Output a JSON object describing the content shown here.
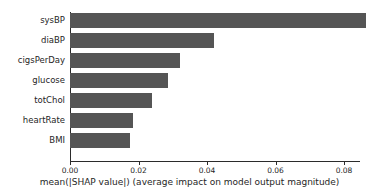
{
  "chart_data": {
    "type": "bar",
    "orientation": "horizontal",
    "title": "",
    "xlabel": "mean(|SHAP value|) (average impact on model output magnitude)",
    "ylabel": "",
    "categories": [
      "sysBP",
      "diaBP",
      "cigsPerDay",
      "glucose",
      "totChol",
      "heartRate",
      "BMI"
    ],
    "values": [
      0.0865,
      0.042,
      0.032,
      0.0287,
      0.024,
      0.0185,
      0.0175
    ],
    "xlim": [
      0.0,
      0.0925
    ],
    "ylim_rows": 7,
    "xticks": [
      0.0,
      0.02,
      0.04,
      0.06,
      0.08
    ],
    "xtick_labels": [
      "0.00",
      "0.02",
      "0.04",
      "0.06",
      "0.08"
    ],
    "grid": false,
    "legend": null,
    "bar_color": "#555555",
    "axis_color": "#2b2b2b",
    "background_color": "#ffffff"
  }
}
